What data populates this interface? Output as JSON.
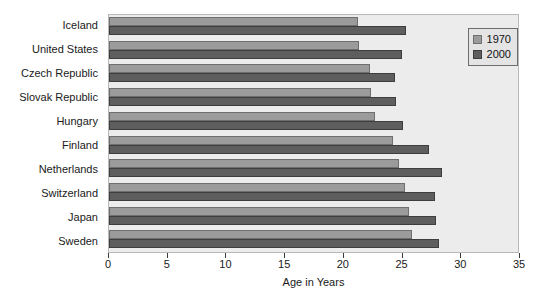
{
  "chart_data": {
    "type": "bar",
    "orientation": "horizontal",
    "title": "",
    "xlabel": "Age in Years",
    "ylabel": "",
    "xlim": [
      0,
      35
    ],
    "xticks": [
      0,
      5,
      10,
      15,
      20,
      25,
      30,
      35
    ],
    "xtick_labels": [
      "0",
      "5",
      "10",
      "15",
      "20",
      "25",
      "30",
      "35"
    ],
    "grid": false,
    "legend_position": "top-right",
    "categories": [
      "Iceland",
      "United States",
      "Czech Republic",
      "Slovak Republic",
      "Hungary",
      "Finland",
      "Netherlands",
      "Switzerland",
      "Japan",
      "Sweden"
    ],
    "series": [
      {
        "name": "1970",
        "color": "#9b9b9b",
        "values": [
          21.3,
          21.4,
          22.3,
          22.4,
          22.8,
          24.3,
          24.8,
          25.3,
          25.7,
          25.9
        ]
      },
      {
        "name": "2000",
        "color": "#5e5e5e",
        "values": [
          25.4,
          25.1,
          24.5,
          24.6,
          25.2,
          27.4,
          28.5,
          27.9,
          28.0,
          28.2
        ]
      }
    ]
  },
  "legend": {
    "entries": [
      {
        "label": "1970"
      },
      {
        "label": "2000"
      }
    ]
  }
}
